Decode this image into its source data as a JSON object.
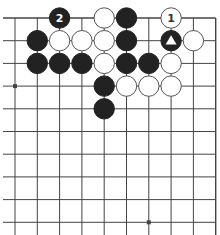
{
  "board": {
    "grid": {
      "cols": 10,
      "rows": 10,
      "x0": 15,
      "y0": 18,
      "dx": 22.3,
      "dy": 22.7,
      "top_edge": true,
      "right_edge": true,
      "left_edge": false,
      "bottom_edge": false
    },
    "colors": {
      "background": "#ffffff",
      "line": "#444444",
      "black_stone": "#222222",
      "white_stone": "#ffffff",
      "white_stone_outline": "#555555",
      "label_on_black": "#ffffff",
      "label_on_white": "#333333"
    },
    "star_points": [
      {
        "col": 0,
        "row": 3
      },
      {
        "col": 6,
        "row": 9
      }
    ],
    "stones": [
      {
        "col": 2,
        "row": 0,
        "color": "black",
        "label": "2"
      },
      {
        "col": 4,
        "row": 0,
        "color": "white"
      },
      {
        "col": 5,
        "row": 0,
        "color": "black"
      },
      {
        "col": 7,
        "row": 0,
        "color": "white",
        "label": "1"
      },
      {
        "col": 1,
        "row": 1,
        "color": "black"
      },
      {
        "col": 2,
        "row": 1,
        "color": "white"
      },
      {
        "col": 3,
        "row": 1,
        "color": "white"
      },
      {
        "col": 4,
        "row": 1,
        "color": "white"
      },
      {
        "col": 5,
        "row": 1,
        "color": "black"
      },
      {
        "col": 7,
        "row": 1,
        "color": "black",
        "marker": "triangle"
      },
      {
        "col": 8,
        "row": 1,
        "color": "white"
      },
      {
        "col": 1,
        "row": 2,
        "color": "black"
      },
      {
        "col": 2,
        "row": 2,
        "color": "black"
      },
      {
        "col": 3,
        "row": 2,
        "color": "black"
      },
      {
        "col": 4,
        "row": 2,
        "color": "white"
      },
      {
        "col": 5,
        "row": 2,
        "color": "black"
      },
      {
        "col": 6,
        "row": 2,
        "color": "black"
      },
      {
        "col": 7,
        "row": 2,
        "color": "white"
      },
      {
        "col": 4,
        "row": 3,
        "color": "black"
      },
      {
        "col": 5,
        "row": 3,
        "color": "white"
      },
      {
        "col": 6,
        "row": 3,
        "color": "white"
      },
      {
        "col": 7,
        "row": 3,
        "color": "white"
      },
      {
        "col": 4,
        "row": 4,
        "color": "black"
      }
    ]
  }
}
